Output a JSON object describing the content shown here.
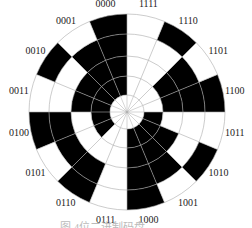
{
  "diagram": {
    "type": "binary code disc",
    "caption": "图  4位二进制码盘",
    "colors": {
      "black": "#000000",
      "white": "#ffffff",
      "grid": "#aaaaaa",
      "text": "#222222"
    },
    "rings_inner_to_outer": 4,
    "sectors": [
      {
        "label": "0000",
        "cells": [
          1,
          1,
          1,
          1
        ]
      },
      {
        "label": "0001",
        "cells": [
          1,
          1,
          1,
          0
        ]
      },
      {
        "label": "0010",
        "cells": [
          1,
          1,
          0,
          1
        ]
      },
      {
        "label": "0011",
        "cells": [
          1,
          1,
          0,
          0
        ]
      },
      {
        "label": "0100",
        "cells": [
          1,
          0,
          1,
          1
        ]
      },
      {
        "label": "0101",
        "cells": [
          1,
          0,
          1,
          0
        ]
      },
      {
        "label": "0110",
        "cells": [
          0,
          0,
          1,
          1
        ]
      },
      {
        "label": "0111",
        "cells": [
          0,
          0,
          0,
          0
        ]
      },
      {
        "label": "1000",
        "cells": [
          1,
          1,
          1,
          1
        ]
      },
      {
        "label": "1001",
        "cells": [
          1,
          1,
          1,
          0
        ]
      },
      {
        "label": "1010",
        "cells": [
          1,
          1,
          0,
          1
        ]
      },
      {
        "label": "1011",
        "cells": [
          1,
          0,
          0,
          0
        ]
      },
      {
        "label": "1100",
        "cells": [
          0,
          1,
          1,
          1
        ]
      },
      {
        "label": "1101",
        "cells": [
          0,
          1,
          1,
          0
        ]
      },
      {
        "label": "1110",
        "cells": [
          0,
          0,
          0,
          1
        ]
      },
      {
        "label": "1111",
        "cells": [
          0,
          0,
          0,
          0
        ]
      }
    ]
  }
}
